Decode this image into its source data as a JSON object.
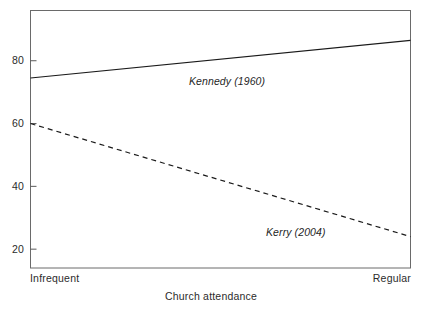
{
  "chart_data": {
    "type": "line",
    "title": "",
    "subtitle": "",
    "xlabel": "Church attendance",
    "ylabel": "",
    "categories": [
      "Infrequent",
      "Regular"
    ],
    "x": [
      0,
      1
    ],
    "xlim": [
      0,
      1
    ],
    "ylim": [
      14,
      96
    ],
    "grid": false,
    "legend_position": "inline-annotation",
    "yticks": [
      20,
      40,
      60,
      80
    ],
    "ytick_labels": [
      "20",
      "40",
      "60",
      "80"
    ],
    "xtick_labels": [
      "Infrequent",
      "Regular"
    ],
    "series": [
      {
        "name": "Kennedy (1960)",
        "style": "solid",
        "color": "#1a1a1a",
        "values": [
          74.5,
          86.5
        ],
        "annotation": "Kennedy (1960)"
      },
      {
        "name": "Kerry (2004)",
        "style": "dashed",
        "color": "#1a1a1a",
        "values": [
          60.0,
          24.0
        ],
        "annotation": "Kerry (2004)"
      }
    ],
    "annotations": [
      {
        "text": "Kennedy (1960)",
        "series": "Kennedy (1960)"
      },
      {
        "text": "Kerry (2004)",
        "series": "Kerry (2004)"
      }
    ]
  },
  "axes": {
    "frame_color": "#555555",
    "tick_color": "#555555",
    "text_color": "#2b2b2b"
  }
}
